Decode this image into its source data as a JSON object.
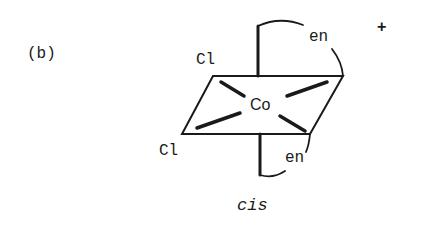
{
  "figure": {
    "panel_label": "(b)",
    "charge": "+",
    "isomer_label": "cis",
    "metal": "Co",
    "ligands": {
      "chloride_top": "Cl",
      "chloride_bottom": "Cl",
      "en_top": "en",
      "en_bottom": "en"
    },
    "colors": {
      "ink": "#1a1a1a",
      "background": "#ffffff"
    }
  }
}
